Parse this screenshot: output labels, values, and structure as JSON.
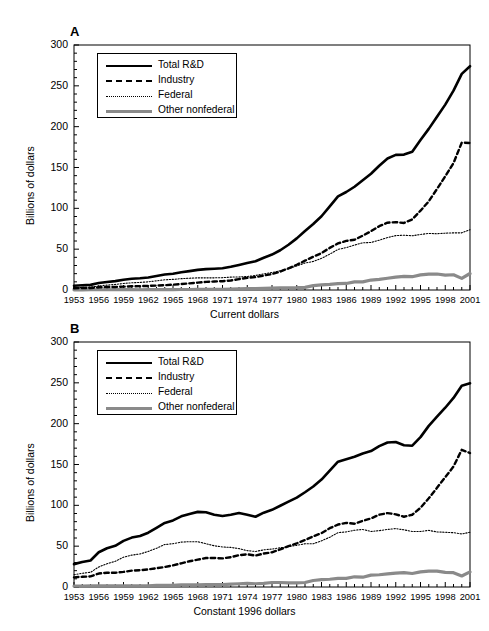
{
  "figure": {
    "panels": [
      {
        "letter": "A",
        "ylabel": "Billions of dollars",
        "xcaption": "Current dollars",
        "yticks": [
          "0",
          "50",
          "100",
          "150",
          "200",
          "250",
          "300"
        ],
        "xticks": [
          "1953",
          "1956",
          "1959",
          "1962",
          "1965",
          "1968",
          "1971",
          "1974",
          "1977",
          "1980",
          "1983",
          "1986",
          "1989",
          "1992",
          "1995",
          "1998",
          "2001"
        ],
        "legend": [
          {
            "label": "Total R&D",
            "style": "solid",
            "color": "#000000"
          },
          {
            "label": "Industry",
            "style": "dashed",
            "color": "#000000"
          },
          {
            "label": "Federal",
            "style": "dotted",
            "color": "#000000"
          },
          {
            "label": "Other nonfederal",
            "style": "thick-gray",
            "color": "#8a8a8a"
          }
        ]
      },
      {
        "letter": "B",
        "ylabel": "Billions of dollars",
        "xcaption": "Constant 1996 dollars",
        "yticks": [
          "0",
          "50",
          "100",
          "150",
          "200",
          "250",
          "300"
        ],
        "xticks": [
          "1953",
          "1956",
          "1959",
          "1962",
          "1965",
          "1968",
          "1971",
          "1974",
          "1977",
          "1980",
          "1983",
          "1986",
          "1989",
          "1992",
          "1995",
          "1998",
          "2001"
        ],
        "legend": [
          {
            "label": "Total R&D",
            "style": "solid",
            "color": "#000000"
          },
          {
            "label": "Industry",
            "style": "dashed",
            "color": "#000000"
          },
          {
            "label": "Federal",
            "style": "dotted",
            "color": "#000000"
          },
          {
            "label": "Other nonfederal",
            "style": "thick-gray",
            "color": "#8a8a8a"
          }
        ]
      }
    ]
  },
  "chart_data": [
    {
      "type": "line",
      "panel": "A",
      "title": "Current dollars",
      "xlabel": "",
      "ylabel": "Billions of dollars",
      "xlim": [
        1953,
        2001
      ],
      "ylim": [
        0,
        300
      ],
      "grid": false,
      "legend_position": "upper left",
      "x": [
        1953,
        1954,
        1955,
        1956,
        1957,
        1958,
        1959,
        1960,
        1961,
        1962,
        1963,
        1964,
        1965,
        1966,
        1967,
        1968,
        1969,
        1970,
        1971,
        1972,
        1973,
        1974,
        1975,
        1976,
        1977,
        1978,
        1979,
        1980,
        1981,
        1982,
        1983,
        1984,
        1985,
        1986,
        1987,
        1988,
        1989,
        1990,
        1991,
        1992,
        1993,
        1994,
        1995,
        1996,
        1997,
        1998,
        1999,
        2000,
        2001
      ],
      "series": [
        {
          "name": "Total R&D",
          "style": "solid",
          "color": "#000000",
          "values": [
            5.2,
            5.8,
            6.3,
            8.5,
            9.9,
            10.9,
            12.5,
            13.7,
            14.3,
            15.4,
            17.1,
            18.9,
            20.0,
            21.8,
            23.1,
            24.6,
            25.6,
            26.1,
            26.7,
            28.5,
            30.7,
            33.0,
            35.2,
            39.4,
            43.4,
            48.7,
            55.4,
            63.2,
            72.3,
            80.9,
            90.3,
            102.3,
            114.7,
            120.0,
            126.4,
            134.3,
            142.4,
            152.1,
            161.0,
            165.4,
            165.8,
            169.2,
            183.6,
            197.3,
            212.2,
            227.0,
            244.1,
            264.6,
            274.0
          ]
        },
        {
          "name": "Industry",
          "style": "dashed",
          "color": "#000000",
          "values": [
            2.2,
            2.4,
            2.5,
            3.3,
            3.6,
            3.7,
            4.1,
            4.5,
            4.7,
            5.0,
            5.4,
            5.9,
            6.5,
            7.3,
            8.1,
            9.0,
            9.9,
            10.4,
            10.8,
            11.7,
            13.3,
            14.9,
            15.8,
            17.7,
            19.6,
            22.5,
            26.6,
            30.9,
            35.9,
            40.7,
            45.2,
            51.6,
            57.1,
            60.1,
            61.5,
            66.5,
            72.0,
            78.1,
            82.4,
            83.1,
            82.1,
            86.5,
            97.1,
            108.6,
            123.7,
            139.2,
            155.4,
            180.4,
            180.0
          ]
        },
        {
          "name": "Federal",
          "style": "dotted",
          "color": "#000000",
          "values": [
            2.8,
            3.2,
            3.5,
            4.9,
            6.0,
            6.8,
            8.0,
            8.8,
            9.3,
            10.0,
            11.2,
            12.5,
            13.0,
            13.9,
            14.4,
            14.9,
            14.9,
            14.9,
            15.1,
            15.8,
            16.0,
            16.5,
            17.8,
            19.8,
            21.4,
            23.5,
            26.1,
            29.5,
            33.1,
            34.9,
            38.8,
            43.9,
            49.7,
            51.9,
            55.0,
            57.8,
            58.2,
            61.0,
            64.2,
            66.6,
            67.1,
            66.4,
            68.0,
            69.3,
            68.9,
            69.6,
            70.0,
            70.0,
            73.8
          ]
        },
        {
          "name": "Other nonfederal",
          "style": "thick-gray",
          "color": "#8a8a8a",
          "values": [
            0.2,
            0.2,
            0.3,
            0.3,
            0.3,
            0.4,
            0.4,
            0.4,
            0.3,
            0.4,
            0.5,
            0.5,
            0.5,
            0.6,
            0.6,
            0.7,
            0.8,
            0.8,
            0.8,
            1.0,
            1.4,
            1.6,
            1.6,
            1.9,
            2.4,
            2.7,
            2.7,
            2.8,
            3.3,
            5.3,
            6.3,
            6.8,
            7.9,
            8.0,
            9.9,
            10.0,
            12.2,
            13.0,
            14.4,
            15.7,
            16.6,
            16.3,
            18.5,
            19.4,
            19.6,
            18.2,
            18.7,
            14.2,
            20.2
          ]
        }
      ]
    },
    {
      "type": "line",
      "panel": "B",
      "title": "Constant 1996 dollars",
      "xlabel": "",
      "ylabel": "Billions of dollars",
      "xlim": [
        1953,
        2001
      ],
      "ylim": [
        0,
        300
      ],
      "grid": false,
      "legend_position": "upper left",
      "x": [
        1953,
        1954,
        1955,
        1956,
        1957,
        1958,
        1959,
        1960,
        1961,
        1962,
        1963,
        1964,
        1965,
        1966,
        1967,
        1968,
        1969,
        1970,
        1971,
        1972,
        1973,
        1974,
        1975,
        1976,
        1977,
        1978,
        1979,
        1980,
        1981,
        1982,
        1983,
        1984,
        1985,
        1986,
        1987,
        1988,
        1989,
        1990,
        1991,
        1992,
        1993,
        1994,
        1995,
        1996,
        1997,
        1998,
        1999,
        2000,
        2001
      ],
      "series": [
        {
          "name": "Total R&D",
          "style": "solid",
          "color": "#000000",
          "values": [
            28.0,
            30.5,
            32.5,
            42.5,
            47.5,
            50.5,
            56.5,
            60.5,
            62.5,
            66.5,
            72.5,
            78.5,
            81.5,
            86.5,
            89.5,
            92.0,
            91.5,
            88.5,
            87.0,
            88.5,
            90.5,
            88.5,
            86.0,
            91.0,
            94.5,
            99.5,
            104.5,
            109.5,
            116.0,
            123.0,
            131.5,
            142.5,
            153.5,
            156.5,
            159.5,
            163.5,
            166.5,
            172.5,
            177.0,
            177.5,
            173.5,
            173.0,
            183.5,
            197.3,
            208.5,
            219.5,
            231.5,
            246.5,
            249.5
          ]
        },
        {
          "name": "Industry",
          "style": "dashed",
          "color": "#000000",
          "values": [
            11.8,
            12.5,
            13.0,
            16.5,
            17.5,
            17.5,
            18.5,
            20.0,
            20.5,
            21.5,
            23.0,
            24.5,
            26.5,
            29.0,
            31.5,
            33.5,
            35.5,
            35.5,
            35.0,
            36.5,
            39.0,
            40.0,
            38.5,
            41.0,
            42.5,
            46.0,
            50.0,
            53.5,
            57.5,
            62.0,
            66.0,
            72.0,
            76.5,
            78.5,
            77.5,
            81.0,
            84.0,
            88.5,
            90.5,
            89.0,
            86.0,
            88.5,
            97.0,
            108.6,
            121.5,
            134.5,
            147.5,
            168.0,
            164.0
          ]
        },
        {
          "name": "Federal",
          "style": "dotted",
          "color": "#000000",
          "values": [
            15.0,
            16.8,
            18.0,
            24.5,
            28.5,
            31.5,
            36.5,
            39.0,
            40.5,
            43.5,
            47.5,
            52.0,
            53.0,
            55.0,
            55.5,
            55.5,
            53.0,
            50.5,
            49.0,
            48.5,
            47.0,
            44.5,
            43.5,
            45.5,
            46.5,
            48.0,
            49.5,
            51.0,
            53.0,
            53.0,
            56.5,
            61.0,
            66.5,
            67.5,
            69.5,
            70.5,
            68.0,
            69.0,
            70.5,
            71.5,
            70.0,
            68.0,
            68.0,
            69.3,
            67.5,
            67.0,
            66.5,
            65.0,
            67.0
          ]
        },
        {
          "name": "Other nonfederal",
          "style": "thick-gray",
          "color": "#8a8a8a",
          "values": [
            1.2,
            1.2,
            1.5,
            1.5,
            1.5,
            1.5,
            1.5,
            1.5,
            1.5,
            1.5,
            2.0,
            2.0,
            2.0,
            2.5,
            2.5,
            2.5,
            3.0,
            3.0,
            3.0,
            3.5,
            4.0,
            4.5,
            4.0,
            4.5,
            5.5,
            5.5,
            5.0,
            5.0,
            5.5,
            8.0,
            9.0,
            9.5,
            10.5,
            10.5,
            12.5,
            12.0,
            14.5,
            15.0,
            16.0,
            17.0,
            17.5,
            16.5,
            18.5,
            19.4,
            19.5,
            18.0,
            17.5,
            13.5,
            18.5
          ]
        }
      ]
    }
  ]
}
